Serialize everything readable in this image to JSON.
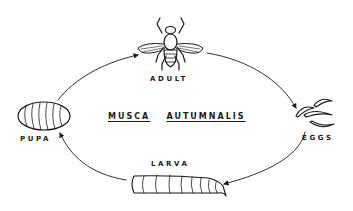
{
  "title": {
    "genus": "MUSCA",
    "species": "AUTUMNALIS"
  },
  "stages": [
    {
      "id": "adult",
      "label": "ADULT"
    },
    {
      "id": "eggs",
      "label": "EGGS"
    },
    {
      "id": "larva",
      "label": "LARVA"
    },
    {
      "id": "pupa",
      "label": "PUPA"
    }
  ],
  "cycle_order": [
    "adult",
    "eggs",
    "larva",
    "pupa",
    "adult"
  ],
  "colors": {
    "ink": "#1a1a1a",
    "background": "#ffffff"
  }
}
